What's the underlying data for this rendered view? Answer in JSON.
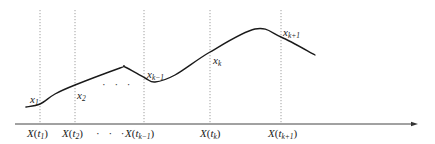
{
  "diagram": {
    "colors": {
      "curve": "#1a1a1a",
      "axis": "#444444",
      "guide_lines": "#888888",
      "background": "#ffffff"
    },
    "curve_points": [
      [
        26,
        107
      ],
      [
        40,
        104
      ],
      [
        55,
        94
      ],
      [
        75,
        85
      ],
      [
        120,
        68
      ],
      [
        125,
        67
      ],
      [
        145,
        78
      ],
      [
        155,
        82
      ],
      [
        175,
        75
      ],
      [
        210,
        52
      ],
      [
        255,
        29
      ],
      [
        281,
        37
      ],
      [
        315,
        55
      ]
    ],
    "guide_lines_x": [
      40,
      75,
      144,
      210,
      281
    ],
    "axis": {
      "y": 124,
      "x_start": 15,
      "x_end": 418
    },
    "point_labels": [
      {
        "id": "x1",
        "base": "x",
        "sub": "1",
        "x": 30,
        "y": 94
      },
      {
        "id": "x2",
        "base": "x",
        "sub": "2",
        "x": 77,
        "y": 90
      },
      {
        "id": "xk-1",
        "base": "x",
        "sub": "k−1",
        "x": 147,
        "y": 69
      },
      {
        "id": "xk",
        "base": "x",
        "sub": "k",
        "x": 213,
        "y": 55
      },
      {
        "id": "xk+1",
        "base": "x",
        "sub": "k+1",
        "x": 283,
        "y": 27
      }
    ],
    "middle_ellipsis": {
      "text": "· · ·",
      "x": 102,
      "y": 78
    },
    "axis_labels": [
      {
        "id": "Xt1",
        "prefix": "X(",
        "var": "t",
        "sub": "1",
        "suffix": ")",
        "x": 27,
        "y": 128
      },
      {
        "id": "Xt2",
        "prefix": "X(",
        "var": "t",
        "sub": "2",
        "suffix": ")",
        "x": 62,
        "y": 128
      },
      {
        "id": "Xtk-1",
        "prefix": "X(",
        "var": "t",
        "sub": "k−1",
        "suffix": ")",
        "x": 125,
        "y": 128
      },
      {
        "id": "Xtk",
        "prefix": "X(",
        "var": "t",
        "sub": "k",
        "suffix": ")",
        "x": 200,
        "y": 128
      },
      {
        "id": "Xtk+1",
        "prefix": "X(",
        "var": "t",
        "sub": "k+1",
        "suffix": ")",
        "x": 268,
        "y": 128
      }
    ],
    "axis_ellipsis": {
      "text": "· · ·",
      "x": 96,
      "y": 128
    }
  }
}
